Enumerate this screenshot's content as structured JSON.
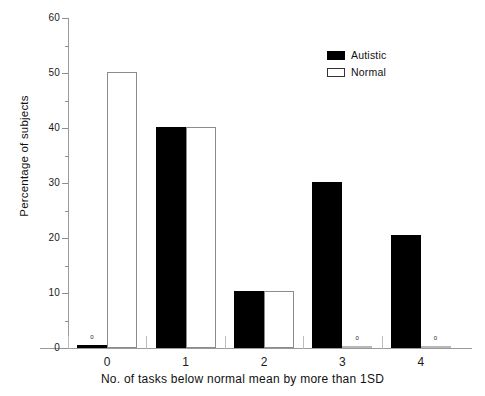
{
  "chart_data": {
    "type": "bar",
    "title": "",
    "xlabel": "No. of tasks below normal mean by more than 1SD",
    "ylabel": "Percentage of subjects",
    "categories": [
      "0",
      "1",
      "2",
      "3",
      "4"
    ],
    "ylim": [
      0,
      60
    ],
    "yticks": [
      0,
      10,
      20,
      30,
      40,
      50,
      60
    ],
    "yticks_minor": [
      5,
      15,
      25,
      35,
      45,
      55
    ],
    "grid": false,
    "legend_position": "top-right",
    "series": [
      {
        "name": "Autistic",
        "color": "#000000",
        "values": [
          0.5,
          40.2,
          10.3,
          30.2,
          20.5
        ]
      },
      {
        "name": "Normal",
        "color": "#ffffff",
        "values": [
          50.2,
          40.2,
          10.3,
          0,
          0
        ]
      }
    ],
    "annotations": [
      {
        "label": "0",
        "series": "Autistic",
        "category": "0"
      },
      {
        "label": "0",
        "series": "Normal",
        "category": "3"
      },
      {
        "label": "0",
        "series": "Normal",
        "category": "4"
      }
    ]
  },
  "axis": {
    "y_tick_labels": [
      "0",
      "10",
      "20",
      "30",
      "40",
      "50",
      "60"
    ],
    "x_tick_labels": [
      "0",
      "1",
      "2",
      "3",
      "4"
    ]
  },
  "legend": {
    "items": [
      {
        "label": "Autistic"
      },
      {
        "label": "Normal"
      }
    ]
  }
}
